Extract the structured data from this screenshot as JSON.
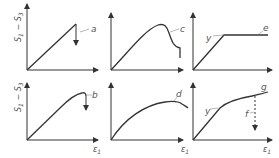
{
  "figure": {
    "y_axis_label": "S",
    "y_axis_label_sub1": "1",
    "y_axis_label_minus": "−",
    "y_axis_label_sub2": "3",
    "x_axis_label": "ε",
    "x_axis_label_sub": "1",
    "colors": {
      "stroke": "#333333",
      "label": "#555555",
      "background": "#ffffff"
    },
    "panels": [
      {
        "id": "a",
        "label": "a",
        "row": 1,
        "col": 1,
        "description": "linear rise then sudden brittle drop"
      },
      {
        "id": "c",
        "label": "c",
        "row": 1,
        "col": 2,
        "description": "rise to peak then softening and drop"
      },
      {
        "id": "e",
        "label": "e",
        "row": 1,
        "col": 3,
        "yield_label": "y",
        "description": "elastic-perfectly plastic"
      },
      {
        "id": "b",
        "label": "b",
        "row": 2,
        "col": 1,
        "description": "rise with slight curvature then brittle drop"
      },
      {
        "id": "d",
        "label": "d",
        "row": 2,
        "col": 2,
        "description": "rounded peak then gradual softening"
      },
      {
        "id": "g",
        "label": "g",
        "row": 2,
        "col": 3,
        "yield_label": "y",
        "failure_label": "f",
        "description": "strain hardening with failure marker"
      }
    ]
  }
}
